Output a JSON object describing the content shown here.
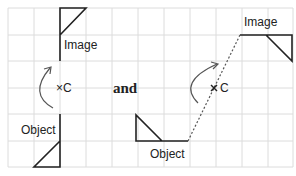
{
  "labels": {
    "left_image": "Image",
    "left_object": "Object",
    "left_center": "×C",
    "connector": "and",
    "right_image": "Image",
    "right_object": "Object",
    "right_center": "C"
  },
  "colors": {
    "grid": "#dcdcdc",
    "stroke": "#222222",
    "arrow": "#555555"
  }
}
